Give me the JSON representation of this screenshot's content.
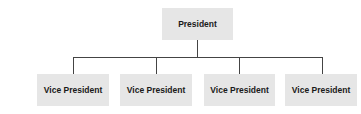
{
  "org_chart": {
    "root": {
      "label": "President"
    },
    "children": [
      {
        "label": "Vice President"
      },
      {
        "label": "Vice President"
      },
      {
        "label": "Vice President"
      },
      {
        "label": "Vice President"
      }
    ]
  },
  "colors": {
    "box_fill": "#e6e6e6",
    "connector": "#444444",
    "text": "#1a1a1a"
  }
}
